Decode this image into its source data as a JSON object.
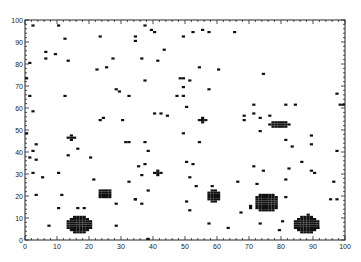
{
  "chart_data": {
    "type": "heatmap",
    "title": "",
    "xlabel": "",
    "ylabel": "",
    "xlim": [
      0,
      100
    ],
    "ylim": [
      0,
      100
    ],
    "grid": false,
    "legend": null,
    "x_ticks": [
      0,
      10,
      20,
      30,
      40,
      50,
      60,
      70,
      80,
      90,
      100
    ],
    "y_ticks": [
      0,
      10,
      20,
      30,
      40,
      50,
      60,
      70,
      80,
      90,
      100
    ],
    "cell_size": 1,
    "cell_color": "#111111",
    "points": [
      [
        2,
        97
      ],
      [
        10,
        97
      ],
      [
        12,
        91
      ],
      [
        6,
        85
      ],
      [
        6,
        82
      ],
      [
        9,
        84
      ],
      [
        13,
        81
      ],
      [
        1,
        80
      ],
      [
        23,
        92
      ],
      [
        22,
        77
      ],
      [
        25,
        78
      ],
      [
        27,
        82
      ],
      [
        37,
        97
      ],
      [
        39,
        95
      ],
      [
        40,
        94
      ],
      [
        34,
        92
      ],
      [
        34,
        90
      ],
      [
        49,
        92
      ],
      [
        52,
        94
      ],
      [
        55,
        95
      ],
      [
        57,
        94
      ],
      [
        65,
        94
      ],
      [
        43,
        86
      ],
      [
        36,
        82
      ],
      [
        41,
        81
      ],
      [
        54,
        78
      ],
      [
        60,
        77
      ],
      [
        0,
        73
      ],
      [
        1,
        65
      ],
      [
        12,
        65
      ],
      [
        2,
        58
      ],
      [
        28,
        68
      ],
      [
        29,
        67
      ],
      [
        32,
        65
      ],
      [
        23,
        54
      ],
      [
        24,
        55
      ],
      [
        30,
        54
      ],
      [
        37,
        72
      ],
      [
        48,
        73
      ],
      [
        49,
        73
      ],
      [
        51,
        72
      ],
      [
        49,
        69
      ],
      [
        57,
        68
      ],
      [
        47,
        65
      ],
      [
        49,
        65
      ],
      [
        50,
        60
      ],
      [
        40,
        57
      ],
      [
        42,
        57
      ],
      [
        44,
        56
      ],
      [
        49,
        48
      ],
      [
        74,
        75
      ],
      [
        97,
        66
      ],
      [
        98,
        61
      ],
      [
        99,
        61
      ],
      [
        71,
        61
      ],
      [
        81,
        61
      ],
      [
        84,
        61
      ],
      [
        68,
        56
      ],
      [
        68,
        54
      ],
      [
        71,
        57
      ],
      [
        73,
        55
      ],
      [
        76,
        56
      ],
      [
        73,
        49
      ],
      [
        89,
        47
      ],
      [
        0,
        48
      ],
      [
        3,
        43
      ],
      [
        2,
        40
      ],
      [
        1,
        37
      ],
      [
        3,
        36
      ],
      [
        13,
        38
      ],
      [
        16,
        41
      ],
      [
        20,
        37
      ],
      [
        31,
        44
      ],
      [
        32,
        44
      ],
      [
        37,
        34
      ],
      [
        2,
        30
      ],
      [
        5,
        28
      ],
      [
        10,
        30
      ],
      [
        21,
        27
      ],
      [
        32,
        26
      ],
      [
        37,
        44
      ],
      [
        38,
        40
      ],
      [
        54,
        44
      ],
      [
        35,
        33
      ],
      [
        36,
        29
      ],
      [
        50,
        35
      ],
      [
        52,
        34
      ],
      [
        51,
        28
      ],
      [
        53,
        24
      ],
      [
        58,
        24
      ],
      [
        66,
        26
      ],
      [
        81,
        45
      ],
      [
        83,
        42
      ],
      [
        89,
        43
      ],
      [
        97,
        40
      ],
      [
        86,
        35
      ],
      [
        71,
        33
      ],
      [
        74,
        31
      ],
      [
        82,
        32
      ],
      [
        89,
        31
      ],
      [
        90,
        30
      ],
      [
        72,
        25
      ],
      [
        81,
        27
      ],
      [
        96,
        26
      ],
      [
        3,
        20
      ],
      [
        11,
        20
      ],
      [
        10,
        14
      ],
      [
        16,
        14
      ],
      [
        18,
        14
      ],
      [
        7,
        6
      ],
      [
        28,
        6
      ],
      [
        28,
        16
      ],
      [
        34,
        18
      ],
      [
        38,
        22
      ],
      [
        34,
        18
      ],
      [
        36,
        16
      ],
      [
        50,
        17
      ],
      [
        51,
        13
      ],
      [
        57,
        7
      ],
      [
        63,
        5
      ],
      [
        38,
        0
      ],
      [
        70,
        14
      ],
      [
        67,
        12
      ],
      [
        70,
        15
      ],
      [
        81,
        19
      ],
      [
        95,
        18
      ],
      [
        97,
        18
      ],
      [
        73,
        7
      ],
      [
        80,
        8
      ],
      [
        79,
        4
      ],
      [
        88,
        11
      ],
      [
        91,
        5
      ]
    ],
    "crosses": [
      {
        "x": 14,
        "y": 46
      },
      {
        "x": 55,
        "y": 54
      },
      {
        "x": 41,
        "y": 30
      }
    ],
    "clusters": [
      {
        "x0": 13,
        "x1": 20,
        "y0": 3,
        "y1": 10,
        "shape": "blob",
        "center": [
          16,
          6
        ]
      },
      {
        "x0": 23,
        "x1": 26,
        "y0": 19,
        "y1": 22,
        "shape": "blob",
        "center": [
          24,
          20
        ]
      },
      {
        "x0": 57,
        "x1": 60,
        "y0": 17,
        "y1": 22,
        "shape": "blob",
        "center": [
          58,
          19
        ]
      },
      {
        "x0": 72,
        "x1": 78,
        "y0": 13,
        "y1": 20,
        "shape": "blob",
        "center": [
          75,
          17
        ]
      },
      {
        "x0": 84,
        "x1": 91,
        "y0": 3,
        "y1": 10,
        "shape": "blob",
        "center": [
          87,
          6
        ]
      },
      {
        "x0": 76,
        "x1": 82,
        "y0": 51,
        "y1": 53,
        "shape": "blob",
        "center": [
          79,
          52
        ]
      }
    ]
  }
}
